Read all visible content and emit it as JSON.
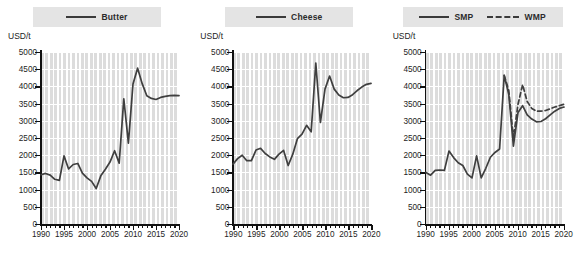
{
  "charts": [
    {
      "legend_items": [
        {
          "label": "Butter",
          "style": "solid"
        }
      ],
      "ylabel": "USD/t",
      "chart_data": {
        "type": "line",
        "title": "Butter",
        "xlabel": "",
        "ylabel": "USD/t",
        "xlim": [
          1990,
          2020
        ],
        "ylim": [
          0,
          5000
        ],
        "yticks": [
          0,
          500,
          1000,
          1500,
          2000,
          2500,
          3000,
          3500,
          4000,
          4500,
          5000
        ],
        "xticks": [
          1990,
          1995,
          2000,
          2005,
          2010,
          2015,
          2020
        ],
        "grid": true,
        "legend_position": "top-center",
        "x": [
          1990,
          1991,
          1992,
          1993,
          1994,
          1995,
          1996,
          1997,
          1998,
          1999,
          2000,
          2001,
          2002,
          2003,
          2004,
          2005,
          2006,
          2007,
          2008,
          2009,
          2010,
          2011,
          2012,
          2013,
          2014,
          2015,
          2016,
          2017,
          2018,
          2019,
          2020
        ],
        "series": [
          {
            "name": "Butter",
            "style": "solid",
            "values": [
              1430,
              1470,
              1420,
              1300,
              1270,
              1980,
              1600,
              1730,
              1760,
              1480,
              1340,
              1240,
              1030,
              1400,
              1590,
              1800,
              2130,
              1770,
              3640,
              2350,
              4070,
              4530,
              4080,
              3730,
              3650,
              3620,
              3680,
              3710,
              3730,
              3740,
              3730
            ]
          }
        ]
      }
    },
    {
      "legend_items": [
        {
          "label": "Cheese",
          "style": "solid"
        }
      ],
      "ylabel": "USD/t",
      "chart_data": {
        "type": "line",
        "title": "Cheese",
        "xlabel": "",
        "ylabel": "USD/t",
        "xlim": [
          1990,
          2020
        ],
        "ylim": [
          0,
          5000
        ],
        "yticks": [
          0,
          500,
          1000,
          1500,
          2000,
          2500,
          3000,
          3500,
          4000,
          4500,
          5000
        ],
        "xticks": [
          1990,
          1995,
          2000,
          2005,
          2010,
          2015,
          2020
        ],
        "grid": true,
        "legend_position": "top-center",
        "x": [
          1990,
          1991,
          1992,
          1993,
          1994,
          1995,
          1996,
          1997,
          1998,
          1999,
          2000,
          2001,
          2002,
          2003,
          2004,
          2005,
          2006,
          2007,
          2008,
          2009,
          2010,
          2011,
          2012,
          2013,
          2014,
          2015,
          2016,
          2017,
          2018,
          2019,
          2020
        ],
        "series": [
          {
            "name": "Cheese",
            "style": "solid",
            "values": [
              1740,
              1900,
              2000,
              1840,
              1840,
              2150,
              2200,
              2050,
              1950,
              1880,
              2030,
              2140,
              1700,
              2030,
              2480,
              2610,
              2870,
              2680,
              4680,
              2950,
              3920,
              4300,
              3920,
              3750,
              3670,
              3680,
              3760,
              3880,
              3980,
              4060,
              4090
            ]
          }
        ]
      }
    },
    {
      "legend_items": [
        {
          "label": "SMP",
          "style": "solid"
        },
        {
          "label": "WMP",
          "style": "dashed"
        }
      ],
      "ylabel": "USD/t",
      "chart_data": {
        "type": "line",
        "title": "SMP and WMP",
        "xlabel": "",
        "ylabel": "USD/t",
        "xlim": [
          1990,
          2020
        ],
        "ylim": [
          0,
          5000
        ],
        "yticks": [
          0,
          500,
          1000,
          1500,
          2000,
          2500,
          3000,
          3500,
          4000,
          4500,
          5000
        ],
        "xticks": [
          1990,
          1995,
          2000,
          2005,
          2010,
          2015,
          2020
        ],
        "grid": true,
        "legend_position": "top-center",
        "x": [
          1990,
          1991,
          1992,
          1993,
          1994,
          1995,
          1996,
          1997,
          1998,
          1999,
          2000,
          2001,
          2002,
          2003,
          2004,
          2005,
          2006,
          2007,
          2008,
          2009,
          2010,
          2011,
          2012,
          2013,
          2014,
          2015,
          2016,
          2017,
          2018,
          2019,
          2020
        ],
        "series": [
          {
            "name": "SMP",
            "style": "solid",
            "values": [
              1500,
              1420,
              1560,
              1570,
              1560,
              2120,
              1930,
              1780,
              1700,
              1450,
              1340,
              1980,
              1340,
              1620,
              1940,
              2080,
              2180,
              4320,
              3760,
              2260,
              3240,
              3440,
              3170,
              3050,
              2970,
              2980,
              3060,
              3170,
              3280,
              3360,
              3400
            ]
          },
          {
            "name": "WMP",
            "style": "dashed",
            "values": [
              null,
              null,
              null,
              null,
              null,
              null,
              null,
              null,
              null,
              null,
              null,
              null,
              null,
              null,
              null,
              null,
              null,
              4320,
              3880,
              2500,
              3480,
              4050,
              3560,
              3360,
              3280,
              3280,
              3300,
              3350,
              3400,
              3440,
              3480
            ]
          }
        ]
      }
    }
  ]
}
